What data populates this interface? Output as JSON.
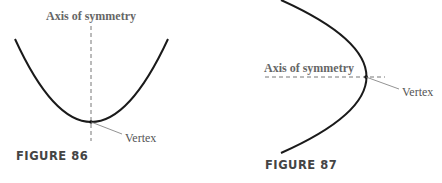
{
  "figures": [
    {
      "id": "figure-86",
      "caption": "FIGURE 86",
      "orientation": "opens-up",
      "axis_label": "Axis of symmetry",
      "vertex_label": "Vertex"
    },
    {
      "id": "figure-87",
      "caption": "FIGURE 87",
      "orientation": "opens-left",
      "axis_label": "Axis of symmetry",
      "vertex_label": "Vertex"
    }
  ],
  "colors": {
    "curve": "#1a1a1a",
    "axis": "#777777",
    "label": "#555555"
  }
}
